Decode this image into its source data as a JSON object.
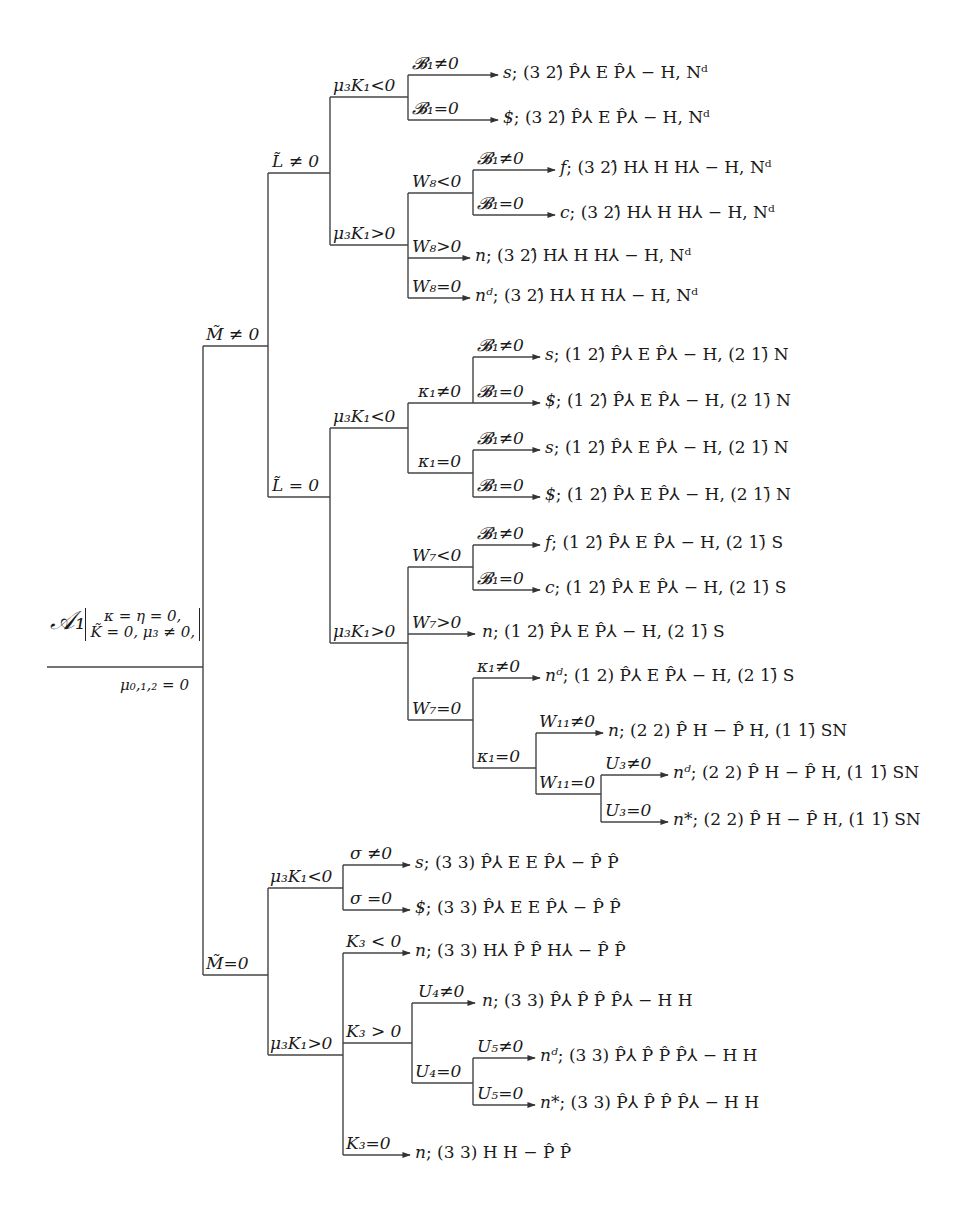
{
  "diagram": {
    "type": "decision-tree",
    "root": {
      "symbol": "𝒜₁",
      "conditions": [
        "κ = η = 0,",
        "K̃ = 0, μ₃ ≠ 0,"
      ],
      "sub": "μ₀,₁,₂ = 0"
    },
    "branches": {
      "m_ne0": "M̃ ≠ 0",
      "l_ne0": "L̃ ≠ 0",
      "l_ne0_mk_lt": "μ₃K₁<0",
      "l_ne0_mk_gt": "μ₃K₁>0",
      "b1_ne0_a": "𝓑₁≠0",
      "b1_eq0_a": "𝓑₁=0",
      "w8_lt": "W₈<0",
      "w8_gt": "W₈>0",
      "w8_eq": "W₈=0",
      "b1_ne0_b": "𝓑₁≠0",
      "b1_eq0_b": "𝓑₁=0",
      "l_eq0": "L̃ = 0",
      "l_eq0_mk_lt": "μ₃K₁<0",
      "k1_ne0_a": "κ₁≠0",
      "k1_eq0_a": "κ₁=0",
      "b1_ne0_c": "𝓑₁≠0",
      "b1_eq0_c": "𝓑₁=0",
      "b1_ne0_d": "𝓑₁≠0",
      "b1_eq0_d": "𝓑₁=0",
      "l_eq0_mk_gt": "μ₃K₁>0",
      "w7_lt": "W₇<0",
      "b1_ne0_e": "𝓑₁≠0",
      "b1_eq0_e": "𝓑₁=0",
      "w7_gt": "W₇>0",
      "w7_eq": "W₇=0",
      "k1_ne0_b": "κ₁≠0",
      "k1_eq0_b": "κ₁=0",
      "w11_ne0": "W₁₁≠0",
      "w11_eq0": "W₁₁=0",
      "u3_ne0": "U₃≠0",
      "u3_eq0": "U₃=0",
      "m_eq0": "M̃=0",
      "m_eq0_mk_lt": "μ₃K₁<0",
      "sigma_ne0": "σ ≠0",
      "sigma_eq0": "σ =0",
      "m_eq0_mk_gt": "μ₃K₁>0",
      "k3_lt": "K₃ < 0",
      "k3_gt": "K₃ > 0",
      "u4_ne0": "U₄≠0",
      "u4_eq0": "U₄=0",
      "u5_ne0": "U₅≠0",
      "u5_eq0": "U₅=0",
      "k3_eq": "K₃=0"
    },
    "leaves": [
      {
        "type": "s",
        "config": "(3 2)̂  P̂⅄ E P̂⅄ − H, Nᵈ"
      },
      {
        "type": "$",
        "config": "(3 2)̂  P̂⅄ E P̂⅄ − H, Nᵈ"
      },
      {
        "type": "f",
        "config": "(3 2)̂  H⅄ H H⅄ − H, Nᵈ"
      },
      {
        "type": "c",
        "config": "(3 2)̂  H⅄ H H⅄ − H, Nᵈ"
      },
      {
        "type": "n",
        "config": "(3 2)̂  H⅄ H H⅄ − H, Nᵈ"
      },
      {
        "type": "nᵈ",
        "config": "(3 2)̂  H⅄ H H⅄ − H, Nᵈ"
      },
      {
        "type": "s",
        "config": "(1 2)̂  P̂⅄ E P̂⅄ − H, (2 1)̄ N"
      },
      {
        "type": "$",
        "config": "(1 2)̂  P̂⅄ E P̂⅄ − H, (2 1)̄ N"
      },
      {
        "type": "s",
        "config": "(1 2)̂  P̂⅄ E P̂⅄ − H, (2 1)̄ N"
      },
      {
        "type": "$",
        "config": "(1 2)̂  P̂⅄ E P̂⅄ − H, (2 1)̄ N"
      },
      {
        "type": "f",
        "config": "(1 2)̂  P̂⅄ E P̂⅄ − H, (2 1)̄ S"
      },
      {
        "type": "c",
        "config": "(1 2)̂  P̂⅄ E P̂⅄ − H, (2 1)̄ S"
      },
      {
        "type": "n",
        "config": "(1 2)̂  P̂⅄ E P̂⅄ − H, (2 1)̄ S"
      },
      {
        "type": "nᵈ",
        "config": "(1 2)  P̂⅄ E P̂⅄ − H, (2 1)̄ S"
      },
      {
        "type": "n",
        "config": "(2 2)  P̂ H − P̂ H, (1 1)̄ SN"
      },
      {
        "type": "nᵈ",
        "config": "(2 2)  P̂ H − P̂ H, (1 1)̄ SN"
      },
      {
        "type": "n*",
        "config": "(2 2)  P̂ H − P̂ H, (1 1)̄ SN"
      },
      {
        "type": "s",
        "config": "(3 3)  P̂⅄ E E P̂⅄ − P̂ P̂"
      },
      {
        "type": "$",
        "config": "(3 3)  P̂⅄ E E P̂⅄ − P̂ P̂"
      },
      {
        "type": "n",
        "config": "(3 3)  H⅄ P̂ P̂ H⅄ − P̂ P̂"
      },
      {
        "type": "n",
        "config": "(3 3)  P̂⅄ P̂ P̂ P̂⅄ − H H"
      },
      {
        "type": "nᵈ",
        "config": "(3 3)  P̂⅄ P̂ P̂ P̂⅄ − H H"
      },
      {
        "type": "n*",
        "config": "(3 3)  P̂⅄ P̂ P̂ P̂⅄ − H H"
      },
      {
        "type": "n",
        "config": "(3 3)  H H − P̂ P̂"
      }
    ]
  }
}
